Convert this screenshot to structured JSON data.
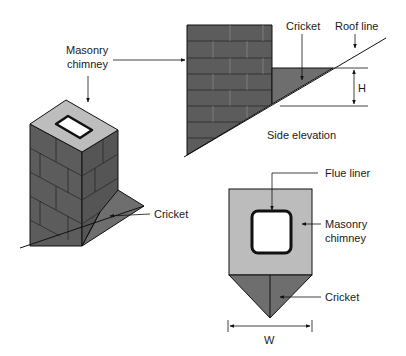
{
  "labels": {
    "masonry_chimney_l1": "Masonry",
    "masonry_chimney_l2": "chimney",
    "cricket_top": "Cricket",
    "roof_line": "Roof line",
    "height_dim": "H",
    "side_elevation": "Side elevation",
    "cricket_iso": "Cricket",
    "flue_liner": "Flue liner",
    "plan_chimney_l1": "Masonry",
    "plan_chimney_l2": "chimney",
    "cricket_plan": "Cricket",
    "width_dim": "W"
  },
  "colors": {
    "brick_dark": "#5c5c5c",
    "brick_mortar": "#8a8a8a",
    "chimney_top": "#bdbdbd",
    "cricket_fill": "#6e6e6e",
    "plan_fill": "#bcbcbc",
    "line": "#111111"
  }
}
